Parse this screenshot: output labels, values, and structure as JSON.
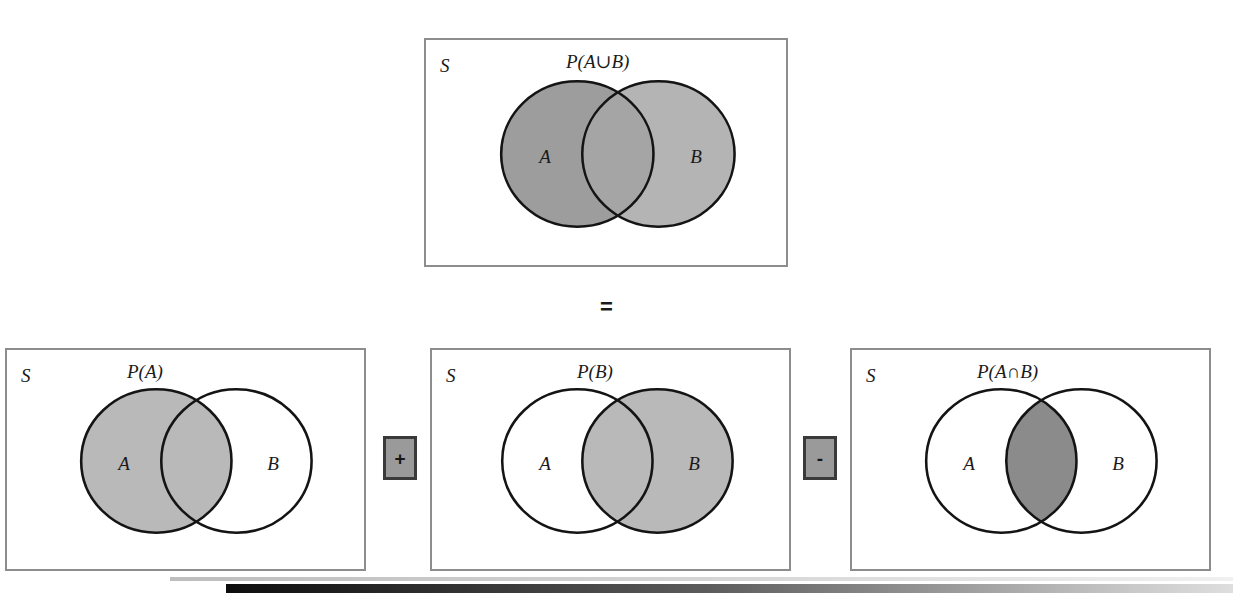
{
  "figure": {
    "kind": "venn-diagram-identity",
    "identity": "P(A∪B) = P(A) + P(B) − P(A∩B)",
    "sample_space_label": "S",
    "set_a_label": "A",
    "set_b_label": "B"
  },
  "equals": {
    "symbol": "="
  },
  "operators": {
    "plus": "+",
    "minus": "-"
  },
  "panels": [
    {
      "id": "union",
      "sample_space": "S",
      "title": "P(A∪B)",
      "left_label": "A",
      "right_label": "B",
      "shaded": "both-circles",
      "fill_a": "#9d9d9d",
      "fill_b": "#b4b4b4",
      "fill_overlap": "#a5a5a5"
    },
    {
      "id": "prob-a",
      "sample_space": "S",
      "title": "P(A)",
      "left_label": "A",
      "right_label": "B",
      "shaded": "circle-a",
      "fill_a": "#b9b9b9",
      "fill_b": "#ffffff",
      "fill_overlap": "#b9b9b9"
    },
    {
      "id": "prob-b",
      "sample_space": "S",
      "title": "P(B)",
      "left_label": "A",
      "right_label": "B",
      "shaded": "circle-b",
      "fill_a": "#ffffff",
      "fill_b": "#b9b9b9",
      "fill_overlap": "#b9b9b9"
    },
    {
      "id": "intersection",
      "sample_space": "S",
      "title": "P(A∩B)",
      "left_label": "A",
      "right_label": "B",
      "shaded": "overlap-only",
      "fill_a": "#ffffff",
      "fill_b": "#ffffff",
      "fill_overlap": "#8b8b8b"
    }
  ],
  "colors": {
    "panel_border": "#8d8d8d",
    "circle_stroke": "#141414",
    "op_box_fill": "#9a9a9a",
    "op_box_border": "#3a3a3a",
    "rule_dark": "#0d0d0d",
    "rule_light": "#dedede"
  }
}
